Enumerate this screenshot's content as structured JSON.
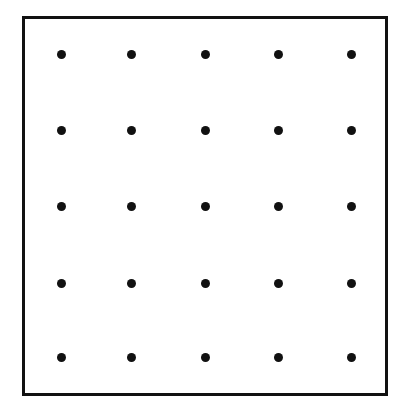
{
  "diagram": {
    "type": "dot-grid",
    "rows": 5,
    "columns": 5,
    "frame": {
      "left": 22,
      "top": 16,
      "right": 388,
      "bottom": 396,
      "stroke_color": "#111111",
      "stroke_width": 3
    },
    "dot": {
      "color": "#111111",
      "diameter": 9
    },
    "column_x": [
      61,
      131,
      205,
      278,
      351
    ],
    "row_y": [
      54,
      130,
      206,
      283,
      357
    ]
  }
}
